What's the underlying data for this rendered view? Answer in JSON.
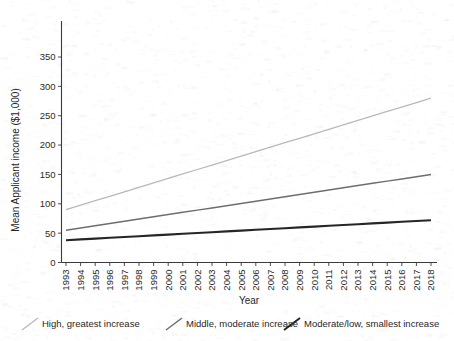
{
  "chart_data": {
    "type": "line",
    "title": "",
    "xlabel": "Year",
    "ylabel": "Mean Applicant income ($1,000)",
    "xlim": [
      1993,
      2018
    ],
    "ylim": [
      0,
      375
    ],
    "ytick_values": [
      0,
      50,
      100,
      150,
      200,
      250,
      300,
      350
    ],
    "ytick_labels": [
      "0",
      "50",
      "100",
      "150",
      "200",
      "250",
      "300",
      "350"
    ],
    "grid": false,
    "legend_position": "below-axis",
    "categories": [
      "1993",
      "1994",
      "1995",
      "1996",
      "1997",
      "1998",
      "1999",
      "2000",
      "2001",
      "2002",
      "2003",
      "2004",
      "2005",
      "2006",
      "2007",
      "2008",
      "2009",
      "2010",
      "2011",
      "2012",
      "2013",
      "2014",
      "2015",
      "2016",
      "2017",
      "2018"
    ],
    "series": [
      {
        "name": "High, greatest increase",
        "color": "#b9b9b9",
        "stroke_width": 1.3,
        "values": [
          90,
          97.6,
          105.2,
          112.8,
          120.4,
          128,
          135.6,
          143.2,
          150.8,
          158.4,
          166,
          173.6,
          181.2,
          188.8,
          196.4,
          204,
          211.6,
          219.2,
          226.8,
          234.4,
          242,
          249.6,
          257.2,
          264.8,
          272.4,
          280
        ]
      },
      {
        "name": "Middle, moderate increase",
        "color": "#6e6e6e",
        "stroke_width": 1.5,
        "values": [
          55,
          58.8,
          62.6,
          66.4,
          70.2,
          74,
          77.8,
          81.6,
          85.4,
          89.2,
          93,
          96.8,
          100.6,
          104.4,
          108.2,
          112,
          115.8,
          119.6,
          123.4,
          127.2,
          131,
          134.8,
          138.6,
          142.4,
          146.2,
          150
        ]
      },
      {
        "name": "Moderate/low, smallest increase",
        "color": "#262626",
        "stroke_width": 2.1,
        "values": [
          38,
          39.36,
          40.72,
          42.08,
          43.44,
          44.8,
          46.16,
          47.52,
          48.88,
          50.24,
          51.6,
          52.96,
          54.32,
          55.68,
          57.04,
          58.4,
          59.76,
          61.12,
          62.48,
          63.84,
          65.2,
          66.56,
          67.92,
          69.28,
          70.64,
          72
        ]
      }
    ]
  }
}
